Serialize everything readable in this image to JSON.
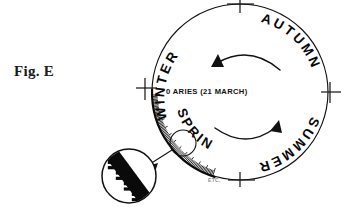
{
  "figure": {
    "caption": "Fig. E",
    "background_color": "#ffffff",
    "ink_color": "#111111"
  },
  "wheel": {
    "center_x": 240,
    "center_y": 92,
    "radius": 88,
    "season_labels": [
      {
        "name": "winter",
        "text": "WINTER",
        "quadrant": "upper-left"
      },
      {
        "name": "autumn",
        "text": "AUTUMN",
        "quadrant": "upper-right"
      },
      {
        "name": "summer",
        "text": "SUMMER",
        "quadrant": "lower-right"
      },
      {
        "name": "spring",
        "text": "SPRING",
        "quadrant": "lower-left"
      }
    ],
    "cardinal_ticks": [
      {
        "name": "top-tick",
        "angle_deg": 270
      },
      {
        "name": "right-tick",
        "angle_deg": 0
      },
      {
        "name": "bottom-tick",
        "angle_deg": 90
      },
      {
        "name": "left-tick",
        "angle_deg": 180
      }
    ],
    "flow_arrows": [
      {
        "name": "upper-arrow",
        "direction": "left"
      },
      {
        "name": "lower-arrow",
        "direction": "right"
      }
    ]
  },
  "annotations": {
    "aries_marker": "0 ARIES (21 MARCH)",
    "etc_marker": "ETC."
  },
  "detail_callout": {
    "label": "graduated-scale-magnifier",
    "highlight_circle": {
      "cx": 183,
      "cy": 143,
      "r": 13
    },
    "magnifier": {
      "cx": 129,
      "cy": 176,
      "r": 27
    },
    "tick_count": 9
  },
  "graduated_arc": {
    "name": "zodiac-degree-scale",
    "start_angle_deg": 178,
    "end_angle_deg": 108,
    "tick_count": 72
  }
}
